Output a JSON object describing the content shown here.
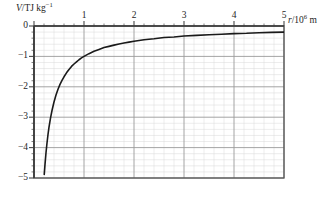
{
  "chart_data": {
    "type": "line",
    "title": "",
    "subtitle": "",
    "xlabel": "r/10^6 m",
    "xlabel_parts": {
      "symbol": "r",
      "sep": "/10",
      "exponent": "6",
      "unit": "m"
    },
    "ylabel": "V/TJ kg^-1",
    "ylabel_parts": {
      "symbol": "V",
      "sep": "/TJ kg",
      "exponent": "−1"
    },
    "xlim": [
      0,
      5
    ],
    "ylim": [
      -5,
      0
    ],
    "xticks": [
      0,
      1,
      2,
      3,
      4,
      5
    ],
    "xtick_labels": [
      "",
      "1",
      "2",
      "3",
      "4",
      "5"
    ],
    "yticks": [
      0,
      -1,
      -2,
      -3,
      -4,
      -5
    ],
    "ytick_labels": [
      "0",
      "−1",
      "−2",
      "−3",
      "−4",
      "−5"
    ],
    "grid": true,
    "grid_major_step_x": 1,
    "grid_major_step_y": 1,
    "grid_minor_per_major": 5,
    "legend": null,
    "legend_position": "none",
    "annotations": [],
    "series": [
      {
        "name": "gravitational potential",
        "equation": "V = -1/r",
        "color": "#1a1a1a",
        "line_width": 1.6,
        "x": [
          0.205,
          0.22,
          0.24,
          0.26,
          0.28,
          0.3,
          0.33,
          0.36,
          0.4,
          0.44,
          0.48,
          0.52,
          0.56,
          0.6,
          0.65,
          0.7,
          0.75,
          0.8,
          0.85,
          0.9,
          0.95,
          1.0,
          1.1,
          1.2,
          1.3,
          1.4,
          1.5,
          1.6,
          1.7,
          1.8,
          1.9,
          2.0,
          2.2,
          2.4,
          2.6,
          2.8,
          3.0,
          3.25,
          3.5,
          3.75,
          4.0,
          4.25,
          4.5,
          4.75,
          5.0
        ],
        "y": [
          -4.88,
          -4.55,
          -4.17,
          -3.85,
          -3.57,
          -3.33,
          -3.03,
          -2.78,
          -2.5,
          -2.27,
          -2.08,
          -1.92,
          -1.79,
          -1.67,
          -1.54,
          -1.43,
          -1.33,
          -1.25,
          -1.18,
          -1.11,
          -1.05,
          -1.0,
          -0.91,
          -0.83,
          -0.77,
          -0.71,
          -0.67,
          -0.63,
          -0.59,
          -0.56,
          -0.53,
          -0.5,
          -0.45,
          -0.42,
          -0.38,
          -0.36,
          -0.33,
          -0.31,
          -0.29,
          -0.27,
          -0.25,
          -0.24,
          -0.22,
          -0.21,
          -0.2
        ]
      }
    ],
    "colors": {
      "curve": "#1a1a1a",
      "frame": "#555555",
      "grid_major": "#9a9a9a",
      "grid_minor": "#d8d8d8",
      "background": "#ffffff",
      "text": "#262626"
    }
  }
}
